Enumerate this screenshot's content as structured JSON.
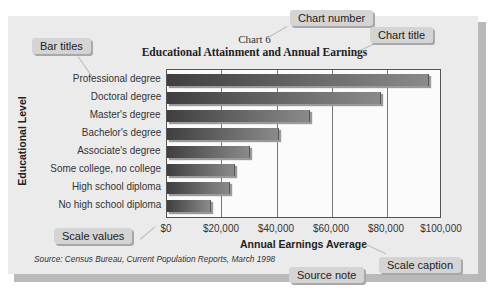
{
  "chart_data": {
    "type": "bar",
    "orientation": "horizontal",
    "number": "Chart 6",
    "title": "Educational Attainment and Annual Earnings",
    "categories": [
      "Professional degree",
      "Doctoral degree",
      "Master's degree",
      "Bachelor's degree",
      "Associate's degree",
      "Some college, no college",
      "High school diploma",
      "No high school diploma"
    ],
    "values": [
      95000,
      77500,
      51500,
      40400,
      29700,
      24500,
      22500,
      15600
    ],
    "xlabel": "Annual Earnings Average",
    "ylabel": "Educational Level",
    "xlim": [
      0,
      100000
    ],
    "x_ticks": [
      "$0",
      "$20,000",
      "$40,000",
      "$60,000",
      "$80,000",
      "$100,000"
    ],
    "grid": true,
    "legend": null,
    "source": "Source: Census Bureau, Current Population Reports, March 1998",
    "bar_color": "#555555"
  },
  "callouts": {
    "chart_number": "Chart number",
    "chart_title": "Chart title",
    "bar_titles": "Bar titles",
    "scale_values": "Scale values",
    "scale_caption": "Scale caption",
    "source_note": "Source note"
  }
}
